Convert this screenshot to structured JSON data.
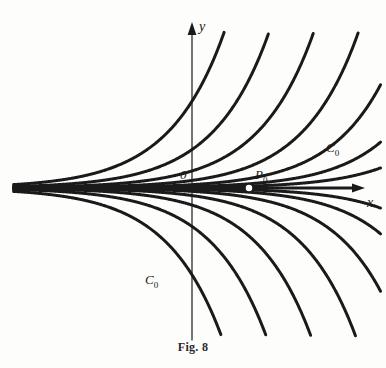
{
  "figure": {
    "caption": "Fig. 8",
    "background_color": "#fdfdfc",
    "ink_color": "#1a1a1a"
  },
  "axes": {
    "x_label": "x",
    "y_label": "y",
    "origin_label": "0",
    "x_axis_y_px": 188,
    "y_axis_x_px": 192,
    "x_axis_range_px": [
      18,
      365
    ],
    "y_axis_range_px": [
      22,
      340
    ],
    "arrowheads": [
      "x-positive",
      "y-positive"
    ]
  },
  "annotations": {
    "point": {
      "label": "P",
      "subscript": "0",
      "marker": "open-circle",
      "x_px": 249,
      "y_px": 188
    },
    "singular_curve_upper": {
      "label": "C",
      "subscript": "0",
      "x_px": 326,
      "y_px": 140
    },
    "singular_curve_lower": {
      "label": "C",
      "subscript": "0",
      "x_px": 145,
      "y_px": 272
    }
  },
  "chart_data": {
    "type": "line",
    "title": "Fig. 8",
    "xlabel": "x",
    "ylabel": "y",
    "grid": false,
    "legend": null,
    "equation": "y = C*e^x",
    "axis_is_solution": true,
    "x_range": [
      -3.5,
      2.6
    ],
    "y_range": [
      -2.6,
      2.6
    ],
    "series": [
      {
        "name": "C = 1.40",
        "C": 1.4,
        "side": "upper"
      },
      {
        "name": "C = 0.62",
        "C": 0.62,
        "side": "upper"
      },
      {
        "name": "C = 0.275",
        "C": 0.275,
        "side": "upper"
      },
      {
        "name": "C = 0.122",
        "C": 0.122,
        "side": "upper"
      },
      {
        "name": "C = 0.054",
        "C": 0.054,
        "side": "upper"
      },
      {
        "name": "C = 0.024",
        "C": 0.024,
        "side": "upper"
      },
      {
        "name": "C = 0.0105",
        "C": 0.0105,
        "side": "upper"
      },
      {
        "name": "C = 0",
        "C": 0,
        "side": "axis"
      },
      {
        "name": "C = -0.0105",
        "C": -0.0105,
        "side": "lower"
      },
      {
        "name": "C = -0.024",
        "C": -0.024,
        "side": "lower"
      },
      {
        "name": "C = -0.054",
        "C": -0.054,
        "side": "lower"
      },
      {
        "name": "C = -0.122",
        "C": -0.122,
        "side": "lower"
      },
      {
        "name": "C = -0.275",
        "C": -0.275,
        "side": "lower"
      },
      {
        "name": "C = -0.62",
        "C": -0.62,
        "side": "lower"
      },
      {
        "name": "C = -1.40",
        "C": -1.4,
        "side": "lower"
      }
    ]
  }
}
